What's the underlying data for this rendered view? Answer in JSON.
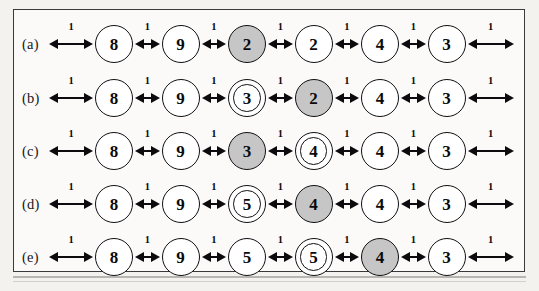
{
  "figure": {
    "caption_labels": [
      "(a)",
      "(b)",
      "(c)",
      "(d)",
      "(e)"
    ],
    "edge_weight": "1",
    "colors": {
      "shaded_fill": "#c6c6c6",
      "plain_fill": "#ffffff",
      "stroke": "#101013",
      "page_background": "#f3f2ef",
      "frame_background": "#fbfaf8"
    }
  },
  "chart_data": {
    "type": "diagram",
    "title": "",
    "node_count_per_row": 6,
    "edge_weight_label": "1",
    "leading_edge": true,
    "trailing_edge": true,
    "rows": [
      {
        "label": "(a)",
        "nodes": [
          {
            "value": "8",
            "style": "plain"
          },
          {
            "value": "9",
            "style": "plain"
          },
          {
            "value": "2",
            "style": "shaded"
          },
          {
            "value": "2",
            "style": "plain"
          },
          {
            "value": "4",
            "style": "plain"
          },
          {
            "value": "3",
            "style": "plain"
          }
        ]
      },
      {
        "label": "(b)",
        "nodes": [
          {
            "value": "8",
            "style": "plain"
          },
          {
            "value": "9",
            "style": "plain"
          },
          {
            "value": "3",
            "style": "ringed"
          },
          {
            "value": "2",
            "style": "shaded"
          },
          {
            "value": "4",
            "style": "plain"
          },
          {
            "value": "3",
            "style": "plain"
          }
        ]
      },
      {
        "label": "(c)",
        "nodes": [
          {
            "value": "8",
            "style": "plain"
          },
          {
            "value": "9",
            "style": "plain"
          },
          {
            "value": "3",
            "style": "shaded"
          },
          {
            "value": "4",
            "style": "ringed"
          },
          {
            "value": "4",
            "style": "plain"
          },
          {
            "value": "3",
            "style": "plain"
          }
        ]
      },
      {
        "label": "(d)",
        "nodes": [
          {
            "value": "8",
            "style": "plain"
          },
          {
            "value": "9",
            "style": "plain"
          },
          {
            "value": "5",
            "style": "ringed"
          },
          {
            "value": "4",
            "style": "shaded"
          },
          {
            "value": "4",
            "style": "plain"
          },
          {
            "value": "3",
            "style": "plain"
          }
        ]
      },
      {
        "label": "(e)",
        "nodes": [
          {
            "value": "8",
            "style": "plain"
          },
          {
            "value": "9",
            "style": "plain"
          },
          {
            "value": "5",
            "style": "plain"
          },
          {
            "value": "5",
            "style": "ringed"
          },
          {
            "value": "4",
            "style": "shaded"
          },
          {
            "value": "3",
            "style": "plain"
          }
        ]
      }
    ]
  }
}
